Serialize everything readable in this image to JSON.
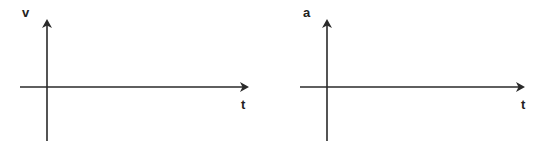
{
  "diagram": {
    "colors": {
      "axis": "#2a2a2a",
      "label": "#222222",
      "background": "#ffffff"
    },
    "graphs": [
      {
        "id": "velocity-time",
        "y_label": "v",
        "x_label": "t",
        "description": "Blank velocity vs time axes"
      },
      {
        "id": "acceleration-time",
        "y_label": "a",
        "x_label": "t",
        "description": "Blank acceleration vs time axes"
      }
    ]
  }
}
